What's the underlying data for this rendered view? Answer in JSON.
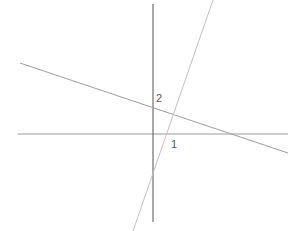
{
  "figure": {
    "width": 305,
    "height": 231,
    "background": "#ffffff"
  },
  "labels": {
    "y_intercept": "2",
    "x_intercept": "1"
  },
  "colors": {
    "y_axis": "#7a7a7a",
    "x_axis": "#9a9a9a",
    "line_descending": "#9e9e9e",
    "line_ascending": "#c2c2c2",
    "label_text": "#5a5a5a",
    "background": "#ffffff"
  },
  "chart_data": {
    "type": "line",
    "title": "",
    "xlabel": "",
    "ylabel": "",
    "grid": false,
    "legend": false,
    "axes": {
      "origin_px": [
        153,
        134
      ],
      "x_axis_px": {
        "y": 134,
        "x_start": 18,
        "x_end": 288
      },
      "y_axis_px": {
        "x": 153,
        "y_start": 4,
        "y_end": 222
      },
      "unit_px": 32,
      "xlim": [
        -4.2,
        4.2
      ],
      "ylim": [
        -2.8,
        4.1
      ]
    },
    "tick_labels": [
      {
        "text": "2",
        "axis": "y",
        "value": 2,
        "px": [
          157,
          99
        ]
      },
      {
        "text": "1",
        "axis": "x",
        "value": 1,
        "px": [
          172,
          146
        ]
      }
    ],
    "series": [
      {
        "name": "descending-line",
        "type": "line",
        "slope": -0.34,
        "y_intercept": 2,
        "x_intercept": 5.9,
        "endpoints_px": [
          [
            20,
            63
          ],
          [
            288,
            153
          ]
        ],
        "endpoints_data": [
          [
            -4.16,
            2.22
          ],
          [
            4.22,
            -0.59
          ]
        ],
        "color": "#9e9e9e"
      },
      {
        "name": "ascending-line",
        "type": "line",
        "slope": 2.9,
        "y_intercept": -2.9,
        "x_intercept": 1,
        "endpoints_px": [
          [
            213,
            0
          ],
          [
            133,
            231
          ]
        ],
        "endpoints_data": [
          [
            1.88,
            4.19
          ],
          [
            -0.63,
            -3.03
          ]
        ],
        "color": "#c2c2c2"
      }
    ],
    "intersection_px": [
      177,
      110
    ],
    "intersection_data": [
      0.75,
      0.75
    ]
  }
}
